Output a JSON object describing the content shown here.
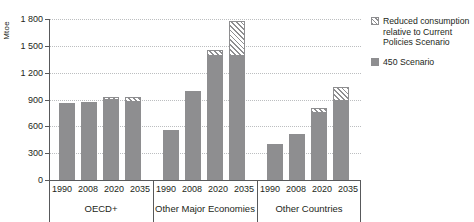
{
  "chart_data": {
    "type": "bar",
    "title": "",
    "subtitle": "",
    "xlabel": "",
    "ylabel": "Mtoe",
    "ylim": [
      0,
      1800
    ],
    "yticks": [
      0,
      300,
      600,
      900,
      1200,
      1500,
      1800
    ],
    "ytick_labels": [
      "0",
      "300",
      "600",
      "900",
      "1 200",
      "1 500",
      "1 800"
    ],
    "grid": true,
    "stacked": true,
    "legend_position": "right",
    "categories": [
      "1990",
      "2008",
      "2020",
      "2035"
    ],
    "groups": [
      {
        "name": "OECD+",
        "values_450": [
          865,
          870,
          895,
          870
        ],
        "values_reduced": [
          0,
          0,
          35,
          60
        ]
      },
      {
        "name": "Other Major Economies",
        "values_450": [
          560,
          990,
          1385,
          1390
        ],
        "values_reduced": [
          0,
          0,
          65,
          390
        ]
      },
      {
        "name": "Other Countries",
        "values_450": [
          400,
          510,
          745,
          880
        ],
        "values_reduced": [
          0,
          0,
          60,
          155
        ]
      }
    ],
    "series": [
      {
        "name": "Reduced consumption relative to Current Policies Scenario",
        "color": "#8e8e90",
        "fill": "hatched"
      },
      {
        "name": "450 Scenario",
        "color": "#8e8e90",
        "fill": "solid"
      }
    ]
  },
  "legend": {
    "items": [
      {
        "swatch": "hatched-swatch",
        "label": "Reduced consumption relative to Current Policies Scenario"
      },
      {
        "swatch": "solid-swatch",
        "label": "450 Scenario"
      }
    ]
  },
  "colors": {
    "bar": "#8e8e90",
    "axis": "#58595b",
    "grid": "#bcbec0",
    "text": "#231f20",
    "background": "#ffffff"
  }
}
